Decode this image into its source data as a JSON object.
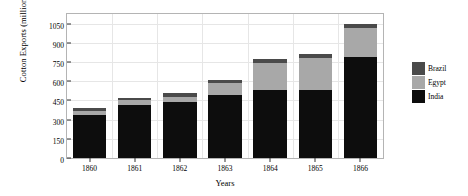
{
  "chart_data": {
    "type": "bar",
    "subtype": "stacked-bar",
    "title": "",
    "xlabel": "Years",
    "ylabel": "Cotton Exports (millions lbs)",
    "categories": [
      "1860",
      "1861",
      "1862",
      "1863",
      "1864",
      "1865",
      "1866"
    ],
    "series": [
      {
        "name": "India",
        "color": "#0d0d0d",
        "values": [
          340,
          415,
          440,
          490,
          530,
          530,
          790
        ]
      },
      {
        "name": "Egypt",
        "color": "#a8a8a8",
        "values": [
          30,
          40,
          40,
          95,
          215,
          255,
          225
        ]
      },
      {
        "name": "Brazil",
        "color": "#4a4a4a",
        "values": [
          20,
          15,
          25,
          25,
          25,
          25,
          30
        ]
      }
    ],
    "stack_order_bottom_to_top": [
      "India",
      "Egypt",
      "Brazil"
    ],
    "totals": [
      390,
      470,
      505,
      610,
      770,
      810,
      1045
    ],
    "ylim": [
      0,
      1125
    ],
    "yticks": [
      0,
      150,
      300,
      450,
      600,
      750,
      900,
      1050
    ],
    "ytick_labels": [
      "0",
      "150",
      "300",
      "450",
      "600",
      "750",
      "900",
      "1050"
    ],
    "grid": true,
    "grid_color": "#e6e6e6",
    "legend": {
      "position": "right",
      "entries": [
        {
          "label": "Brazil",
          "color": "#4a4a4a"
        },
        {
          "label": "Egypt",
          "color": "#a8a8a8"
        },
        {
          "label": "India",
          "color": "#0d0d0d"
        }
      ]
    },
    "plot_border_color": "#b4b4b4",
    "background": "#ffffff"
  }
}
